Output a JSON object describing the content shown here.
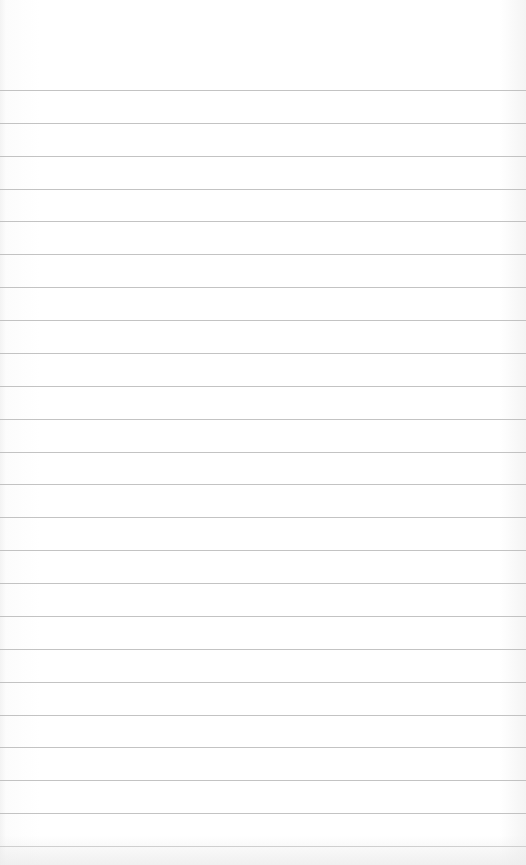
{
  "page": {
    "type": "blank-lined-notepad",
    "line_count": 24,
    "first_line_y": 90,
    "line_spacing": 32.87,
    "line_color": "#b8b8b8",
    "paper_color": "#ffffff"
  }
}
